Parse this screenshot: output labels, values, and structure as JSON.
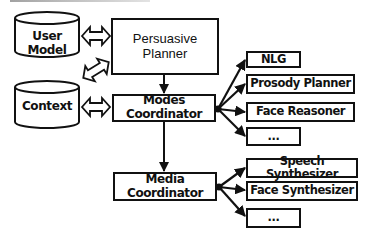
{
  "diagram": {
    "databases": {
      "user_model": {
        "label": "User Model"
      },
      "context": {
        "label": "Context"
      }
    },
    "planner": {
      "line1": "Persuasive",
      "line2": "Planner"
    },
    "modes_coordinator": {
      "label": "Modes Coordinator"
    },
    "media_coordinator": {
      "label": "Media Coordinator"
    },
    "mode_modules": [
      {
        "label": "NLG"
      },
      {
        "label": "Prosody Planner"
      },
      {
        "label": "Face Reasoner"
      },
      {
        "label": "..."
      }
    ],
    "media_modules": [
      {
        "label": "Speech Synthesizer"
      },
      {
        "label": "Face Synthesizer"
      },
      {
        "label": "..."
      }
    ],
    "connections": [
      {
        "from": "User Model",
        "to": "Persuasive Planner",
        "type": "bidirectional"
      },
      {
        "from": "Context",
        "to": "Persuasive Planner",
        "type": "bidirectional"
      },
      {
        "from": "Context",
        "to": "Modes Coordinator",
        "type": "bidirectional"
      },
      {
        "from": "Persuasive Planner",
        "to": "Modes Coordinator",
        "type": "arrow"
      },
      {
        "from": "Modes Coordinator",
        "to": "Media Coordinator",
        "type": "arrow"
      },
      {
        "from": "Modes Coordinator",
        "to": [
          "NLG",
          "Prosody Planner",
          "Face Reasoner",
          "..."
        ],
        "type": "fan-out"
      },
      {
        "from": "Media Coordinator",
        "to": [
          "Speech Synthesizer",
          "Face Synthesizer",
          "..."
        ],
        "type": "fan-out"
      }
    ],
    "colors": {
      "stroke": "#111111",
      "background": "#ffffff"
    }
  }
}
